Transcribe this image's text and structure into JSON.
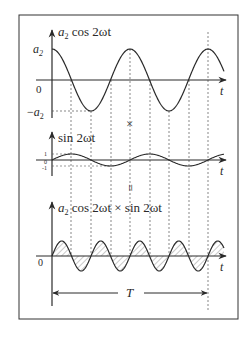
{
  "figure": {
    "frame": {
      "x": 19,
      "y": 15,
      "w": 219,
      "h": 304
    },
    "colors": {
      "ink": "#2a2a2a",
      "dash": "#555555",
      "hatch": "#777777",
      "frame": "#333333"
    },
    "period_px": 78,
    "origin_x": 52,
    "dashed_x": [
      71,
      91,
      111,
      130,
      150,
      169,
      189,
      208
    ],
    "operator_times": "×",
    "operator_equals": "=",
    "t_label": "t",
    "T_label": "T"
  },
  "panels": [
    {
      "id": "cos",
      "label_coef": "a",
      "label_sub": "2",
      "label_rest": " cos 2ωt",
      "axis_y": 80,
      "amplitude_px": 31,
      "y_ticks": [
        {
          "text": "a",
          "sub": "2",
          "prefix": "",
          "y": 49
        },
        {
          "text": "0",
          "sub": "",
          "prefix": "",
          "y": 90
        },
        {
          "text": "a",
          "sub": "2",
          "prefix": "−",
          "y": 112
        }
      ]
    },
    {
      "id": "sin",
      "label_rest": "sin 2ωt",
      "axis_y": 160,
      "amplitude_px": 6,
      "y_ticks": [
        {
          "text": "1",
          "y": 154
        },
        {
          "text": "0",
          "y": 163
        },
        {
          "text": "-1",
          "y": 168
        }
      ]
    },
    {
      "id": "product",
      "label_coef": "a",
      "label_sub": "2",
      "label_rest": " cos 2ωt × sin 2ωt",
      "axis_y": 256,
      "amplitude_px": 15,
      "y_ticks": [
        {
          "text": "0",
          "y": 265
        }
      ]
    }
  ],
  "chart_data": {
    "type": "line",
    "series": [
      {
        "name": "a2 cos 2ωt",
        "function": "a2*cos(2ωt)",
        "amplitude": "a2",
        "y_ticks": [
          "a2",
          "0",
          "-a2"
        ]
      },
      {
        "name": "sin 2ωt",
        "function": "sin(2ωt)",
        "amplitude": 1,
        "y_ticks": [
          "1",
          "0",
          "-1"
        ]
      },
      {
        "name": "a2 cos 2ωt × sin 2ωt",
        "function": "(a2/2)*sin(4ωt)",
        "amplitude": "a2/2",
        "shaded": true,
        "y_ticks": [
          "0"
        ]
      }
    ],
    "xlabel": "t",
    "annotations": [
      "×",
      "=",
      "T (interval spanning 2 periods of cos 2ωt)"
    ]
  }
}
